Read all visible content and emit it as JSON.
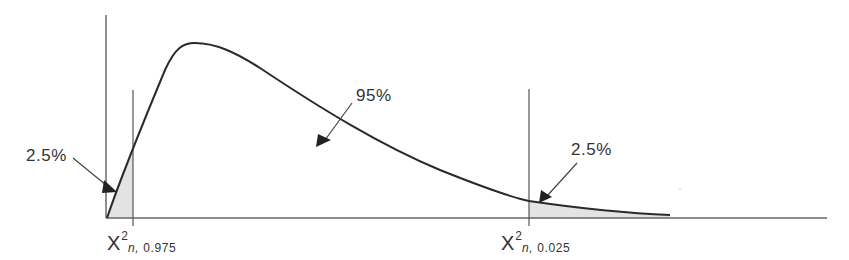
{
  "diagram": {
    "type": "chi-square distribution with two-tailed critical regions",
    "labels": {
      "center_area": "95%",
      "left_tail_area": "2.5%",
      "right_tail_area": "2.5%"
    },
    "critical_values": {
      "left": {
        "symbol": "X",
        "superscript": "2",
        "subscript_var": "n,",
        "subscript_val": " 0.975"
      },
      "right": {
        "symbol": "X",
        "superscript": "2",
        "subscript_var": "n,",
        "subscript_val": " 0.025"
      }
    },
    "colors": {
      "curve": "#2a2a2a",
      "axis": "#555555",
      "shaded_region": "#e3e3e3",
      "text": "#333333"
    }
  }
}
